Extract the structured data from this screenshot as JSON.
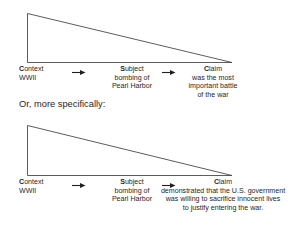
{
  "page": {
    "background_color": "#ffffff",
    "text_color": "#1f1f1f",
    "line_color": "#4a4a4a"
  },
  "interstitial": {
    "text": "Or, more specifically:"
  },
  "diagram_top": {
    "name": "context-subject-claim-general",
    "columns": {
      "context": {
        "head_cap": "C",
        "head_rest": "ontext",
        "lines": [
          "WWII"
        ]
      },
      "subject": {
        "head_cap": "S",
        "head_rest": "ubject",
        "lines": [
          "bombing of",
          "Pearl Harbor"
        ]
      },
      "claim": {
        "head_cap": "C",
        "head_rest": "laim",
        "lines": [
          "was the most",
          "important battle",
          "of the war"
        ]
      }
    }
  },
  "diagram_bottom": {
    "name": "context-subject-claim-specific",
    "columns": {
      "context": {
        "head_cap": "C",
        "head_rest": "ontext",
        "lines": [
          "WWII"
        ]
      },
      "subject": {
        "head_cap": "S",
        "head_rest": "ubject",
        "lines": [
          "bombing of",
          "Pearl Harbor"
        ]
      },
      "claim": {
        "head_cap": "C",
        "head_rest": "laim",
        "lines": [
          "demonstrated that the U.S. government",
          "was willing to sacrifice innocent lives",
          "to justify entering the war."
        ]
      }
    }
  }
}
